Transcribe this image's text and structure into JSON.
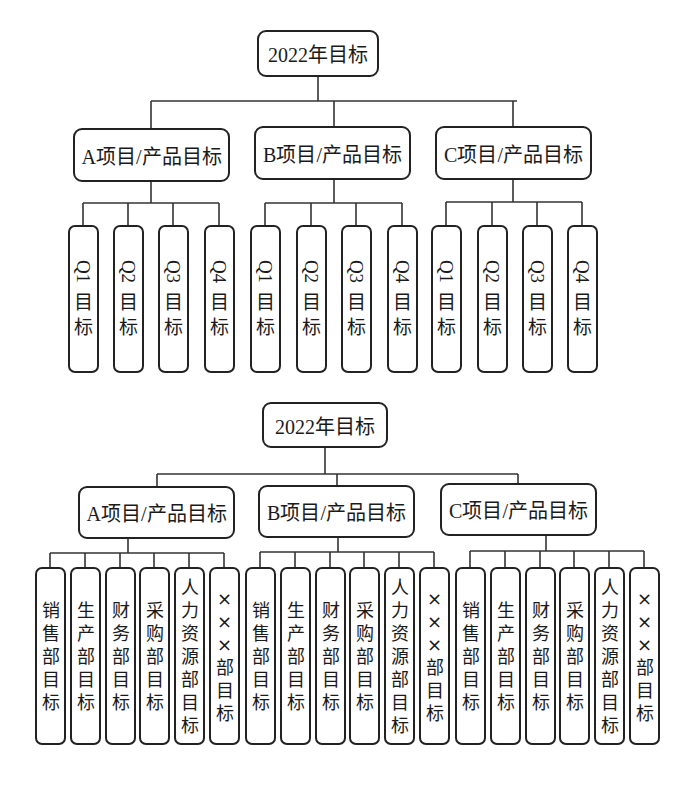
{
  "diagram1": {
    "root": "2022年目标",
    "projects": [
      "A项目/产品目标",
      "B项目/产品目标",
      "C项目/产品目标"
    ],
    "quarters": [
      {
        "q": "Q1",
        "suffix": [
          "目",
          "标"
        ]
      },
      {
        "q": "Q2",
        "suffix": [
          "目",
          "标"
        ]
      },
      {
        "q": "Q3",
        "suffix": [
          "目",
          "标"
        ]
      },
      {
        "q": "Q4",
        "suffix": [
          "目",
          "标"
        ]
      }
    ]
  },
  "diagram2": {
    "root": "2022年目标",
    "projects": [
      "A项目/产品目标",
      "B项目/产品目标",
      "C项目/产品目标"
    ],
    "departments": [
      {
        "label": "销售部目标",
        "chars": [
          "销",
          "售",
          "部",
          "目",
          "标"
        ]
      },
      {
        "label": "生产部目标",
        "chars": [
          "生",
          "产",
          "部",
          "目",
          "标"
        ]
      },
      {
        "label": "财务部目标",
        "chars": [
          "财",
          "务",
          "部",
          "目",
          "标"
        ]
      },
      {
        "label": "采购部目标",
        "chars": [
          "采",
          "购",
          "部",
          "目",
          "标"
        ]
      },
      {
        "label": "人力资源部目标",
        "chars": [
          "人",
          "力",
          "资",
          "源",
          "部",
          "目",
          "标"
        ]
      },
      {
        "label": "×××部目标",
        "chars": [
          "×",
          "×",
          "×",
          "部",
          "目",
          "标"
        ]
      }
    ]
  }
}
